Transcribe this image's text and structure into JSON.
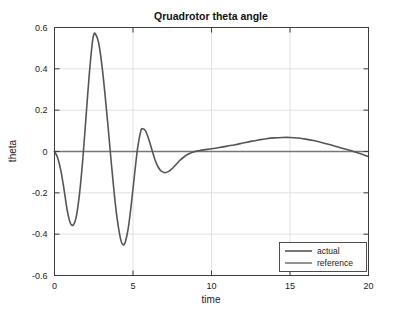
{
  "chart_data": {
    "type": "line",
    "title": "Qruadrotor theta angle",
    "xlabel": "time",
    "ylabel": "theta",
    "xlim": [
      0,
      20
    ],
    "ylim": [
      -0.6,
      0.6
    ],
    "xticks": [
      "0",
      "5",
      "10",
      "15",
      "20"
    ],
    "xtick_values": [
      0,
      5,
      10,
      15,
      20
    ],
    "yticks": [
      "0.6",
      "0.4",
      "0.2",
      "0",
      "-0.2",
      "-0.4",
      "-0.6"
    ],
    "ytick_values": [
      0.6,
      0.4,
      0.2,
      0,
      -0.2,
      -0.4,
      -0.6
    ],
    "grid": true,
    "legend_position": "lower right",
    "legend": [
      "actual",
      "reference"
    ],
    "series": [
      {
        "name": "actual",
        "color": "#555555",
        "x": [
          0.0,
          0.2,
          0.4,
          0.6,
          0.8,
          1.0,
          1.2,
          1.4,
          1.6,
          1.8,
          2.0,
          2.2,
          2.4,
          2.5,
          2.6,
          2.8,
          3.0,
          3.2,
          3.4,
          3.6,
          3.8,
          4.0,
          4.2,
          4.35,
          4.5,
          4.7,
          4.9,
          5.1,
          5.3,
          5.5,
          5.6,
          5.8,
          6.0,
          6.2,
          6.4,
          6.6,
          6.8,
          7.0,
          7.1,
          7.3,
          7.5,
          7.8,
          8.0,
          8.3,
          8.6,
          8.9,
          9.2,
          9.5,
          10.0,
          10.5,
          11.0,
          11.5,
          12.0,
          12.5,
          13.0,
          13.5,
          14.0,
          14.5,
          15.0,
          15.5,
          16.0,
          16.5,
          17.0,
          17.5,
          18.0,
          18.5,
          19.0,
          19.5,
          20.0
        ],
        "y": [
          0.0,
          -0.03,
          -0.09,
          -0.18,
          -0.28,
          -0.345,
          -0.355,
          -0.31,
          -0.2,
          -0.04,
          0.16,
          0.36,
          0.52,
          0.565,
          0.57,
          0.53,
          0.43,
          0.29,
          0.13,
          -0.04,
          -0.2,
          -0.33,
          -0.42,
          -0.45,
          -0.44,
          -0.37,
          -0.25,
          -0.11,
          0.02,
          0.1,
          0.11,
          0.1,
          0.06,
          0.01,
          -0.04,
          -0.075,
          -0.095,
          -0.102,
          -0.102,
          -0.095,
          -0.082,
          -0.058,
          -0.042,
          -0.023,
          -0.01,
          -0.001,
          0.004,
          0.008,
          0.013,
          0.019,
          0.026,
          0.033,
          0.041,
          0.049,
          0.056,
          0.062,
          0.066,
          0.068,
          0.068,
          0.065,
          0.06,
          0.053,
          0.044,
          0.034,
          0.023,
          0.012,
          0.001,
          -0.011,
          -0.025
        ]
      },
      {
        "name": "reference",
        "color": "#777777",
        "x": [
          0,
          20
        ],
        "y": [
          0,
          0
        ]
      }
    ],
    "annotations": {
      "first_min": {
        "t": 1.1,
        "value": -0.355
      },
      "first_max": {
        "t": 2.55,
        "value": 0.57
      },
      "second_min": {
        "t": 4.35,
        "value": -0.45
      },
      "second_max": {
        "t": 5.6,
        "value": 0.11
      },
      "third_min": {
        "t": 7.05,
        "value": -0.102
      },
      "slow_max": {
        "t": 14.3,
        "value": 0.068
      },
      "final_value": {
        "t": 20,
        "value": -0.025
      }
    }
  },
  "colors": {
    "actual_line": "#555555",
    "reference_line": "#777777",
    "axis": "#3d3d3d",
    "grid": "#d9d9d9",
    "background": "#ffffff",
    "text": "#1a1a1a"
  }
}
